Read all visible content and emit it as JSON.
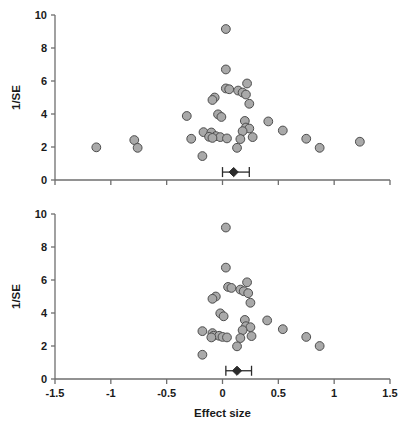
{
  "figure": {
    "name": "funnel-plot-pair",
    "background": "#ffffff",
    "marker_fill": "#a9a9a9",
    "marker_stroke": "#4d4d4d",
    "axis_color": "#6e6e6e",
    "text_color": "#1a1a1a"
  },
  "chart_data": [
    {
      "type": "scatter",
      "panel": "top",
      "title": "",
      "xlabel": "",
      "ylabel": "1/SE",
      "xlim": [
        -1.5,
        1.5
      ],
      "ylim": [
        0,
        10
      ],
      "xticks": [
        -1.5,
        -1,
        -0.5,
        0,
        0.5,
        1,
        1.5
      ],
      "xticklabels": [
        "-1.5",
        "-1",
        "-0.5",
        "0",
        "0.5",
        "1",
        "1.5"
      ],
      "yticks": [
        0,
        2,
        4,
        6,
        8,
        10
      ],
      "yticklabels": [
        "0",
        "2",
        "4",
        "6",
        "8",
        "10"
      ],
      "grid": false,
      "legend": "none",
      "x_tick_labels_shown": false,
      "points": [
        {
          "x": 0.03,
          "y": 9.15
        },
        {
          "x": 0.03,
          "y": 6.7
        },
        {
          "x": 0.22,
          "y": 5.85
        },
        {
          "x": 0.03,
          "y": 5.55
        },
        {
          "x": 0.06,
          "y": 5.5
        },
        {
          "x": 0.14,
          "y": 5.42
        },
        {
          "x": 0.18,
          "y": 5.3
        },
        {
          "x": 0.21,
          "y": 5.18
        },
        {
          "x": -0.07,
          "y": 5.0
        },
        {
          "x": -0.09,
          "y": 4.85
        },
        {
          "x": 0.24,
          "y": 4.62
        },
        {
          "x": -0.32,
          "y": 3.88
        },
        {
          "x": -0.04,
          "y": 3.98
        },
        {
          "x": -0.01,
          "y": 3.82
        },
        {
          "x": 0.2,
          "y": 3.58
        },
        {
          "x": 0.41,
          "y": 3.55
        },
        {
          "x": 0.21,
          "y": 3.18
        },
        {
          "x": 0.24,
          "y": 3.12
        },
        {
          "x": 0.54,
          "y": 3.0
        },
        {
          "x": 0.18,
          "y": 2.96
        },
        {
          "x": -0.17,
          "y": 2.9
        },
        {
          "x": -0.1,
          "y": 2.88
        },
        {
          "x": -0.28,
          "y": 2.5
        },
        {
          "x": -0.12,
          "y": 2.62
        },
        {
          "x": -0.06,
          "y": 2.66
        },
        {
          "x": -0.02,
          "y": 2.6
        },
        {
          "x": -0.09,
          "y": 2.55
        },
        {
          "x": 0.04,
          "y": 2.52
        },
        {
          "x": 0.16,
          "y": 2.48
        },
        {
          "x": 0.27,
          "y": 2.6
        },
        {
          "x": 0.75,
          "y": 2.5
        },
        {
          "x": -0.79,
          "y": 2.42
        },
        {
          "x": 1.23,
          "y": 2.32
        },
        {
          "x": -1.13,
          "y": 1.98
        },
        {
          "x": -0.76,
          "y": 1.95
        },
        {
          "x": 0.87,
          "y": 1.95
        },
        {
          "x": 0.13,
          "y": 1.95
        },
        {
          "x": -0.18,
          "y": 1.45
        }
      ],
      "summary": {
        "estimate": 0.1,
        "ci_low": 0.0,
        "ci_high": 0.24,
        "y": 0.48
      }
    },
    {
      "type": "scatter",
      "panel": "bottom",
      "title": "",
      "xlabel": "Effect size",
      "ylabel": "1/SE",
      "xlim": [
        -1.5,
        1.5
      ],
      "ylim": [
        0,
        10
      ],
      "xticks": [
        -1.5,
        -1,
        -0.5,
        0,
        0.5,
        1,
        1.5
      ],
      "xticklabels": [
        "-1.5",
        "-1",
        "-0.5",
        "0",
        "0.5",
        "1",
        "1.5"
      ],
      "yticks": [
        0,
        2,
        4,
        6,
        8,
        10
      ],
      "yticklabels": [
        "0",
        "2",
        "4",
        "6",
        "8",
        "10"
      ],
      "grid": false,
      "legend": "none",
      "x_tick_labels_shown": true,
      "points": [
        {
          "x": 0.03,
          "y": 9.18
        },
        {
          "x": 0.03,
          "y": 6.75
        },
        {
          "x": 0.22,
          "y": 5.86
        },
        {
          "x": 0.05,
          "y": 5.58
        },
        {
          "x": 0.08,
          "y": 5.52
        },
        {
          "x": 0.16,
          "y": 5.42
        },
        {
          "x": 0.19,
          "y": 5.32
        },
        {
          "x": 0.23,
          "y": 5.2
        },
        {
          "x": -0.06,
          "y": 5.0
        },
        {
          "x": -0.09,
          "y": 4.86
        },
        {
          "x": 0.25,
          "y": 4.62
        },
        {
          "x": -0.02,
          "y": 3.98
        },
        {
          "x": 0.01,
          "y": 3.8
        },
        {
          "x": 0.2,
          "y": 3.58
        },
        {
          "x": 0.4,
          "y": 3.55
        },
        {
          "x": 0.21,
          "y": 3.2
        },
        {
          "x": 0.25,
          "y": 3.14
        },
        {
          "x": 0.54,
          "y": 3.02
        },
        {
          "x": 0.18,
          "y": 2.96
        },
        {
          "x": -0.18,
          "y": 2.9
        },
        {
          "x": -0.09,
          "y": 2.78
        },
        {
          "x": -0.08,
          "y": 2.62
        },
        {
          "x": -0.03,
          "y": 2.62
        },
        {
          "x": -0.1,
          "y": 2.52
        },
        {
          "x": 0.0,
          "y": 2.55
        },
        {
          "x": 0.04,
          "y": 2.52
        },
        {
          "x": 0.16,
          "y": 2.48
        },
        {
          "x": 0.26,
          "y": 2.6
        },
        {
          "x": 0.75,
          "y": 2.55
        },
        {
          "x": 0.13,
          "y": 1.98
        },
        {
          "x": 0.87,
          "y": 2.0
        },
        {
          "x": -0.18,
          "y": 1.47
        }
      ],
      "summary": {
        "estimate": 0.13,
        "ci_low": 0.03,
        "ci_high": 0.26,
        "y": 0.5
      }
    }
  ]
}
